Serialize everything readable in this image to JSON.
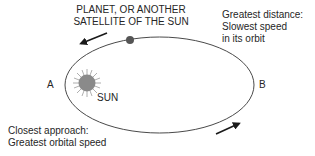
{
  "diagram": {
    "labels": {
      "planet": [
        "PLANET, OR ANOTHER",
        "SATELLITE OF THE SUN"
      ],
      "greatest_distance": [
        "Greatest distance:",
        "Slowest speed",
        "in its orbit"
      ],
      "closest_approach": [
        "Closest approach:",
        "Greatest orbital speed"
      ],
      "point_a": "A",
      "point_b": "B",
      "sun": "SUN"
    },
    "nodes": [
      {
        "id": "sun",
        "label": "SUN",
        "shape": "circle-with-rays",
        "cx": 87,
        "cy": 83,
        "r": 9,
        "color": "#8a8a8a"
      },
      {
        "id": "planet",
        "label": "PLANET, OR ANOTHER SATELLITE OF THE SUN",
        "shape": "circle",
        "cx": 130,
        "cy": 40,
        "r": 4,
        "color": "#555555"
      },
      {
        "id": "A",
        "label": "A",
        "position": "left end of orbit (perihelion)"
      },
      {
        "id": "B",
        "label": "B",
        "position": "right end of orbit (aphelion)"
      }
    ],
    "orbit": {
      "shape": "ellipse",
      "cx": 159.5,
      "cy": 85,
      "rx": 94.5,
      "ry": 48,
      "stroke": "#4a4a4a"
    },
    "edges": [
      {
        "id": "top-arrow",
        "direction": "counterclockwise",
        "from": [
          107,
          33
        ],
        "to": [
          80,
          44
        ]
      },
      {
        "id": "bottom-arrow",
        "direction": "counterclockwise",
        "from": [
          216,
          134
        ],
        "to": [
          240,
          123
        ]
      }
    ],
    "colors": {
      "line": "#4a4a4a",
      "sun": "#8a8a8a",
      "planet": "#555555",
      "text": "#262626"
    }
  }
}
